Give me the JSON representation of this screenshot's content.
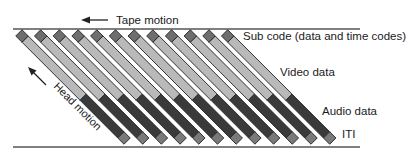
{
  "diagram": {
    "title_arrow_label": "Tape motion",
    "head_motion_label": "Head motion",
    "labels": {
      "subcode": "Sub code (data and time codes)",
      "video": "Video data",
      "audio": "Audio data",
      "iti": "ITI"
    },
    "track_count": 12,
    "colors": {
      "subcode": "#6e6e6e",
      "video": "#b9b9b9",
      "audio": "#3a3a3a",
      "iti": "#7a7a7a",
      "outline": "#2a2a2a",
      "tape_edge": "#555555"
    }
  }
}
